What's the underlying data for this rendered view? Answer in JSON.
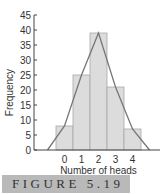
{
  "chart_data": {
    "type": "bar",
    "subtype": "histogram-with-frequency-polygon",
    "categories": [
      "0",
      "1",
      "2",
      "3",
      "4"
    ],
    "values": [
      8,
      25,
      39,
      21,
      7
    ],
    "polygon": {
      "x": [
        -1,
        0,
        1,
        2,
        3,
        4,
        5
      ],
      "y": [
        0,
        8,
        25,
        39,
        21,
        7,
        0
      ]
    },
    "title": "",
    "xlabel": "Number of heads",
    "ylabel": "Frequency",
    "ylim": [
      0,
      45
    ],
    "yticks": [
      0,
      5,
      10,
      15,
      20,
      25,
      30,
      35,
      40,
      45
    ],
    "grid": false,
    "legend": null,
    "colors": {
      "bar_fill": "#dcdcdc",
      "bar_edge": "#a8a8a8",
      "polygon": "#777777",
      "axis": "#444444"
    }
  },
  "caption": {
    "label": "FIGURE 5.19"
  }
}
